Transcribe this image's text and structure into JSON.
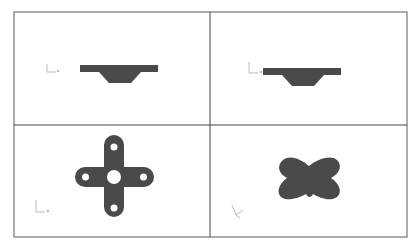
{
  "figure": {
    "layout": "2x2 grid of CAD viewports",
    "border_color": "#555555",
    "shape_fill": "#4a4a4a",
    "background": "#ffffff",
    "viewports": [
      {
        "position": "top-left",
        "view": "front",
        "shape": "flanged-profile",
        "triad": "front-triad-icon"
      },
      {
        "position": "top-right",
        "view": "side",
        "shape": "flanged-profile",
        "triad": "side-triad-icon"
      },
      {
        "position": "bottom-left",
        "view": "top",
        "shape": "cross-plate-with-holes",
        "triad": "top-triad-icon"
      },
      {
        "position": "bottom-right",
        "view": "isometric",
        "shape": "cross-plate-iso",
        "triad": "iso-triad-icon"
      }
    ]
  }
}
